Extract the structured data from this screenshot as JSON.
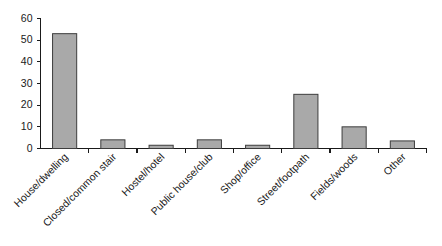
{
  "chart_data": {
    "type": "bar",
    "title": "",
    "subtitle": "",
    "xlabel": "",
    "ylabel": "",
    "ylim": [
      0,
      60
    ],
    "ytick_step": 10,
    "yticks": [
      0,
      10,
      20,
      30,
      40,
      50,
      60
    ],
    "grid": false,
    "legend": null,
    "legend_position": "none",
    "categories": [
      "House/dwelling",
      "Closed/common stair",
      "Hostel/hotel",
      "Public house/club",
      "Shop/office",
      "Street/footpath",
      "Fields/woods",
      "Other"
    ],
    "values": [
      53,
      4,
      1.5,
      4,
      1.5,
      25,
      10,
      3.5
    ],
    "bar_color": "#a9a9a9",
    "bar_edge_color": "#3d3d3d",
    "axis_color": "#1a1a1a",
    "background_color": "#ffffff",
    "xtick_label_rotation": 45
  }
}
